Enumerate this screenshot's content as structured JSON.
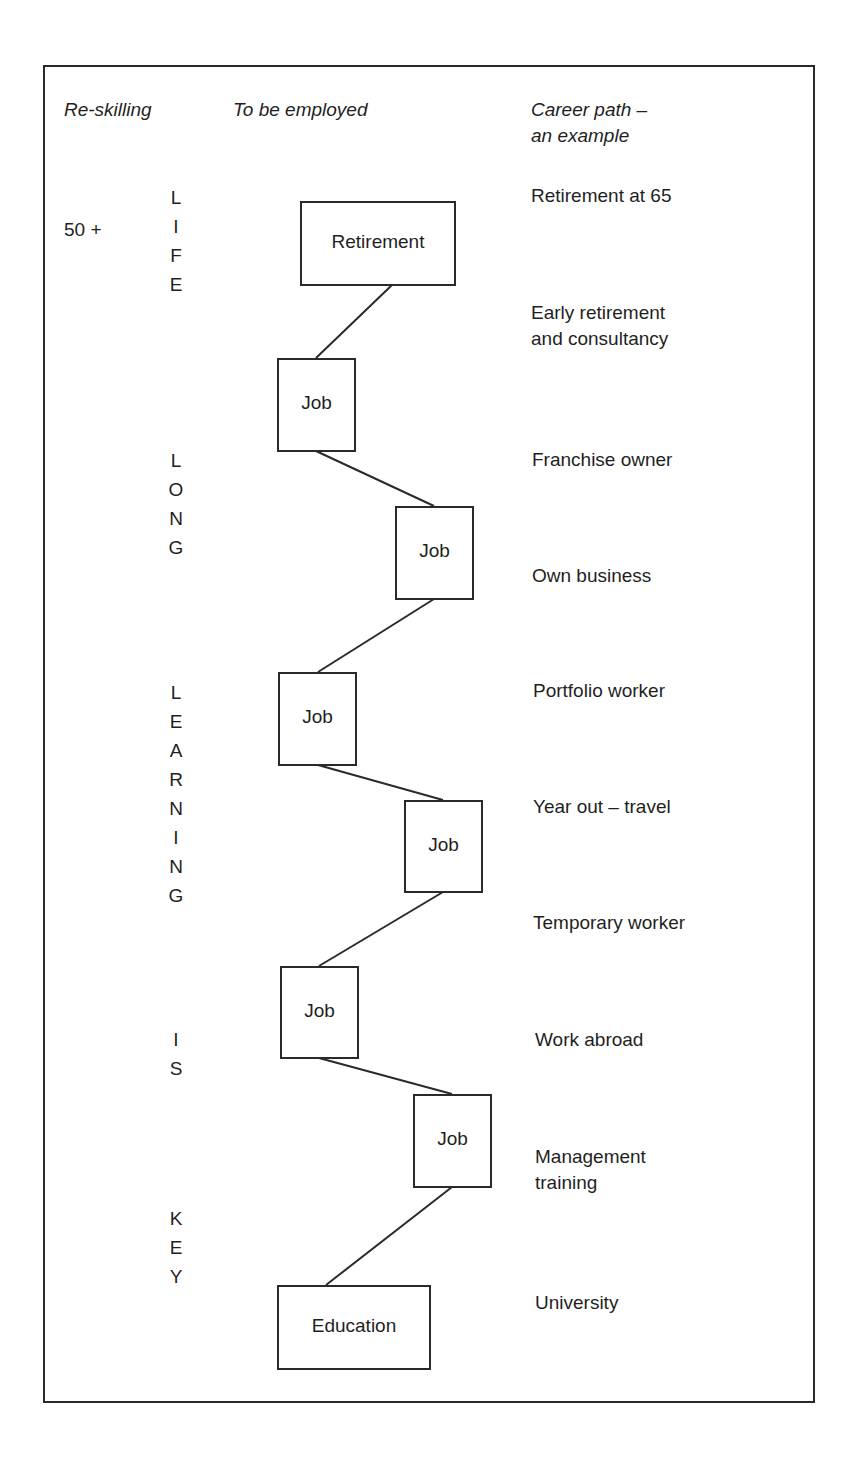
{
  "headers": {
    "reskilling": "Re-skilling",
    "to_be_employed": "To be employed",
    "career_path_line1": "Career path –",
    "career_path_line2": "an example"
  },
  "age_label": "50 +",
  "vertical_words": [
    {
      "word": "LIFE",
      "letters": [
        "L",
        "I",
        "F",
        "E"
      ]
    },
    {
      "word": "LONG",
      "letters": [
        "L",
        "O",
        "N",
        "G"
      ]
    },
    {
      "word": "LEARNING",
      "letters": [
        "L",
        "E",
        "A",
        "R",
        "N",
        "I",
        "N",
        "G"
      ]
    },
    {
      "word": "IS",
      "letters": [
        "I",
        "S"
      ]
    },
    {
      "word": "KEY",
      "letters": [
        "K",
        "E",
        "Y"
      ]
    }
  ],
  "boxes": [
    {
      "id": "retirement",
      "label": "Retirement"
    },
    {
      "id": "job1",
      "label": "Job"
    },
    {
      "id": "job2",
      "label": "Job"
    },
    {
      "id": "job3",
      "label": "Job"
    },
    {
      "id": "job4",
      "label": "Job"
    },
    {
      "id": "job5",
      "label": "Job"
    },
    {
      "id": "job6",
      "label": "Job"
    },
    {
      "id": "education",
      "label": "Education"
    }
  ],
  "career_path": [
    {
      "line1": "Retirement at 65"
    },
    {
      "line1": "Early retirement",
      "line2": "and consultancy"
    },
    {
      "line1": "Franchise owner"
    },
    {
      "line1": "Own business"
    },
    {
      "line1": "Portfolio worker"
    },
    {
      "line1": "Year out – travel"
    },
    {
      "line1": "Temporary worker"
    },
    {
      "line1": "Work abroad"
    },
    {
      "line1": "Management",
      "line2": "training"
    },
    {
      "line1": "University"
    }
  ]
}
